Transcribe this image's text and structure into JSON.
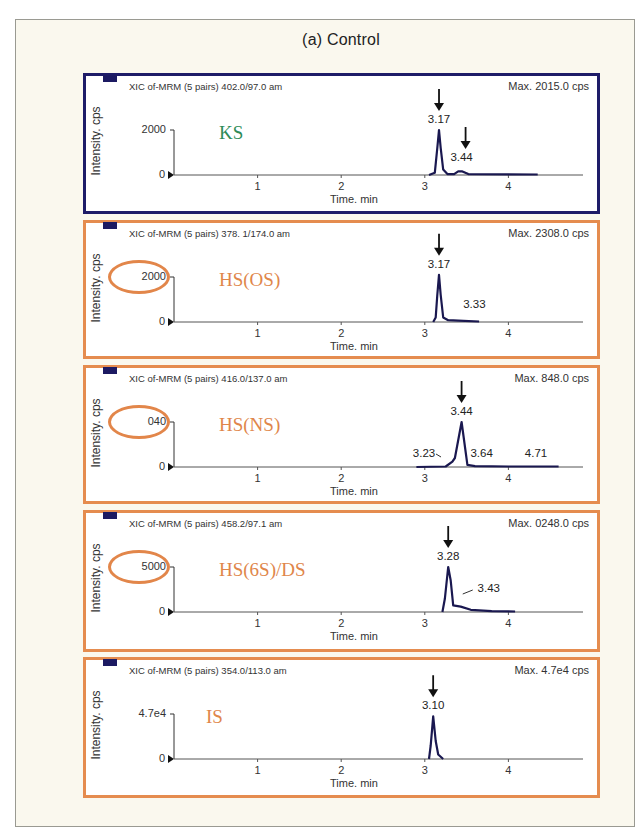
{
  "figure": {
    "title": "(a) Control",
    "colors": {
      "card_bg": "#faf8ee",
      "navy_border": "#1e1c68",
      "orange_border": "#e58c4f",
      "ks_label": "#2e8b57",
      "hs_label": "#e0864a",
      "trace": "#1a1850"
    }
  },
  "chart_data": [
    {
      "type": "line",
      "title": "XIC of-MRM (5 pairs) 402.0/97.0 am",
      "compound": "KS",
      "max_label": "Max. 2015.0 cps",
      "xlabel": "Time. min",
      "ylabel": "Intensity. cps",
      "x_ticks": [
        1,
        2,
        3,
        4
      ],
      "y_ticks": [
        "0",
        "2000"
      ],
      "y_top_highlighted": false,
      "border": "navy",
      "label_color": "#2e8b57",
      "peaks": [
        {
          "time": 3.17,
          "label": "3.17",
          "arrow": true
        },
        {
          "time": 3.44,
          "label": "3.44",
          "arrow": true
        }
      ],
      "trace": [
        [
          3.05,
          0
        ],
        [
          3.12,
          0.05
        ],
        [
          3.15,
          0.6
        ],
        [
          3.17,
          1.0
        ],
        [
          3.19,
          0.6
        ],
        [
          3.22,
          0.12
        ],
        [
          3.27,
          0.02
        ],
        [
          3.35,
          0.02
        ],
        [
          3.4,
          0.08
        ],
        [
          3.45,
          0.08
        ],
        [
          3.52,
          0.02
        ],
        [
          4.35,
          0.01
        ]
      ]
    },
    {
      "type": "line",
      "title": "XIC of-MRM (5 pairs) 378. 1/174.0 am",
      "compound": "HS(OS)",
      "max_label": "Max. 2308.0 cps",
      "xlabel": "Time. min",
      "ylabel": "Intensity. cps",
      "x_ticks": [
        1,
        2,
        3,
        4
      ],
      "y_ticks": [
        "0",
        "2000"
      ],
      "y_top_highlighted": true,
      "border": "orange",
      "label_color": "#e0864a",
      "peaks": [
        {
          "time": 3.17,
          "label": "3.17",
          "arrow": true
        },
        {
          "time": 3.33,
          "label": "3.33",
          "arrow": false
        }
      ],
      "trace": [
        [
          3.1,
          0
        ],
        [
          3.13,
          0.1
        ],
        [
          3.15,
          0.6
        ],
        [
          3.17,
          1.05
        ],
        [
          3.19,
          0.6
        ],
        [
          3.22,
          0.1
        ],
        [
          3.28,
          0.04
        ],
        [
          3.4,
          0.03
        ],
        [
          3.65,
          0.01
        ]
      ]
    },
    {
      "type": "line",
      "title": "XIC of-MRM (5 pairs) 416.0/137.0 am",
      "compound": "HS(NS)",
      "max_label": "Max. 848.0 cps",
      "xlabel": "Time. min",
      "ylabel": "Intensity. cps",
      "x_ticks": [
        1,
        2,
        3,
        4
      ],
      "y_ticks": [
        "0",
        "040"
      ],
      "y_top_highlighted": true,
      "border": "orange",
      "label_color": "#e0864a",
      "peaks": [
        {
          "time": 3.44,
          "label": "3.44",
          "arrow": true
        },
        {
          "time": 3.23,
          "label": "3.23",
          "arrow": false
        },
        {
          "time": 3.64,
          "label": "3.64",
          "arrow": false
        },
        {
          "time": 4.71,
          "label": "4.71",
          "arrow": false
        }
      ],
      "trace": [
        [
          2.9,
          0
        ],
        [
          3.25,
          0.01
        ],
        [
          3.33,
          0.12
        ],
        [
          3.36,
          0.2
        ],
        [
          3.44,
          1.0
        ],
        [
          3.51,
          0.05
        ],
        [
          3.6,
          0.02
        ],
        [
          4.0,
          0.01
        ],
        [
          4.6,
          0.01
        ]
      ]
    },
    {
      "type": "line",
      "title": "XIC of-MRM (5 pairs) 458.2/97.1 am",
      "compound": "HS(6S)/DS",
      "max_label": "Max. 0248.0 cps",
      "xlabel": "Time. min",
      "ylabel": "Intensity. cps",
      "x_ticks": [
        1,
        2,
        3,
        4
      ],
      "y_ticks": [
        "0",
        "5000"
      ],
      "y_top_highlighted": true,
      "border": "orange",
      "label_color": "#e0864a",
      "peaks": [
        {
          "time": 3.28,
          "label": "3.28",
          "arrow": true
        },
        {
          "time": 3.43,
          "label": "3.43",
          "arrow": false
        }
      ],
      "trace": [
        [
          3.21,
          0
        ],
        [
          3.24,
          0.3
        ],
        [
          3.28,
          1.0
        ],
        [
          3.31,
          0.7
        ],
        [
          3.34,
          0.15
        ],
        [
          3.43,
          0.12
        ],
        [
          3.55,
          0.05
        ],
        [
          3.8,
          0.02
        ],
        [
          4.08,
          0.01
        ]
      ]
    },
    {
      "type": "line",
      "title": "XIC of-MRM (5 pairs) 354.0/113.0 am",
      "compound": "IS",
      "max_label": "Max. 4.7e4 cps",
      "xlabel": "Time. min",
      "ylabel": "Intensity. cps",
      "x_ticks": [
        1,
        2,
        3,
        4
      ],
      "y_ticks": [
        "0",
        "4.7e4"
      ],
      "y_top_highlighted": false,
      "border": "orange",
      "label_color": "#e0864a",
      "peaks": [
        {
          "time": 3.1,
          "label": "3.10",
          "arrow": true
        }
      ],
      "trace": [
        [
          3.05,
          0
        ],
        [
          3.07,
          0.3
        ],
        [
          3.1,
          0.95
        ],
        [
          3.13,
          0.4
        ],
        [
          3.16,
          0.1
        ],
        [
          3.22,
          0
        ]
      ]
    }
  ],
  "panels_text": [
    {
      "xic": "XIC of-MRM (5 pairs) 402.0/97.0 am",
      "max": "Max. 2015.0 cps",
      "ylabel": "Intensity. cps",
      "ytop": "2000",
      "yzero": "0",
      "compound": "KS",
      "xtitle": "Time. min",
      "ticks": [
        "1",
        "2",
        "3",
        "4"
      ]
    },
    {
      "xic": "XIC of-MRM (5 pairs) 378. 1/174.0 am",
      "max": "Max. 2308.0 cps",
      "ylabel": "Intensity. cps",
      "ytop": "2000",
      "yzero": "0",
      "compound": "HS(OS)",
      "xtitle": "Time. min",
      "ticks": [
        "1",
        "2",
        "3",
        "4"
      ]
    },
    {
      "xic": "XIC of-MRM (5 pairs) 416.0/137.0 am",
      "max": "Max. 848.0 cps",
      "ylabel": "Intensity. cps",
      "ytop": "040",
      "yzero": "0",
      "compound": "HS(NS)",
      "xtitle": "Time. min",
      "ticks": [
        "1",
        "2",
        "3",
        "4"
      ]
    },
    {
      "xic": "XIC of-MRM (5 pairs) 458.2/97.1 am",
      "max": "Max. 0248.0 cps",
      "ylabel": "Intensity. cps",
      "ytop": "5000",
      "yzero": "0",
      "compound": "HS(6S)/DS",
      "xtitle": "Time. min",
      "ticks": [
        "1",
        "2",
        "3",
        "4"
      ]
    },
    {
      "xic": "XIC of-MRM (5 pairs) 354.0/113.0 am",
      "max": "Max. 4.7e4 cps",
      "ylabel": "Intensity. cps",
      "ytop": "4.7e4",
      "yzero": "0",
      "compound": "IS",
      "xtitle": "Time. min",
      "ticks": [
        "1",
        "2",
        "3",
        "4"
      ]
    }
  ]
}
